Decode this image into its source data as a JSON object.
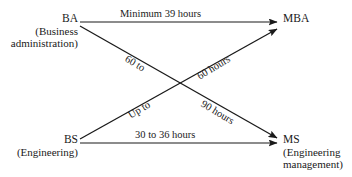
{
  "diagram": {
    "background_color": "#ffffff",
    "line_color": "#1a1a1a",
    "text_color": "#1a1a1a",
    "nodes": [
      {
        "id": "ba",
        "title": "BA",
        "sub_line_1": "(Business",
        "sub_line_2": "administration)",
        "position": "top-left"
      },
      {
        "id": "bs",
        "title": "BS",
        "sub_line_1": "(Engineering)",
        "sub_line_2": "",
        "position": "bottom-left"
      },
      {
        "id": "mba",
        "title": "MBA",
        "sub_line_1": "",
        "sub_line_2": "",
        "position": "top-right"
      },
      {
        "id": "ms",
        "title": "MS",
        "sub_line_1": "(Engineering",
        "sub_line_2": "management)",
        "position": "bottom-right"
      }
    ],
    "edges": [
      {
        "id": "ba-to-mba",
        "from": "BA",
        "to": "MBA",
        "label": "Minimum 39 hours",
        "orientation": "horizontal-top"
      },
      {
        "id": "bs-to-ms",
        "from": "BS",
        "to": "MS",
        "label": "30 to 36 hours",
        "orientation": "horizontal-bottom"
      },
      {
        "id": "ba-to-ms",
        "from": "BA",
        "to": "MS",
        "label_line_1": "60 to",
        "label_line_2": "90 hours",
        "orientation": "diagonal-descending"
      },
      {
        "id": "bs-to-mba",
        "from": "BS",
        "to": "MBA",
        "label_line_1": "Up to",
        "label_line_2": "60 hours",
        "orientation": "diagonal-ascending"
      }
    ]
  }
}
